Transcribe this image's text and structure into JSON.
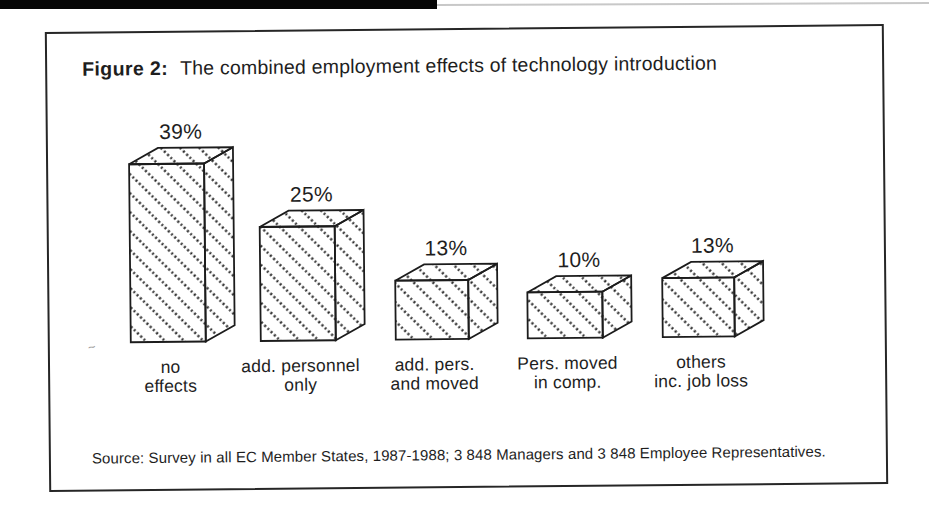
{
  "figure": {
    "label": "Figure 2:",
    "title": "The combined employment effects of technology introduction",
    "source": "Source: Survey in all EC Member States, 1987-1988; 3 848 Managers and 3 848 Employee Representatives."
  },
  "chart_data": {
    "type": "bar",
    "style": "3d-hatched-boxes",
    "unit": "%",
    "title": "The combined employment effects of technology introduction",
    "categories": [
      "no effects",
      "add. personnel only",
      "add. pers. and moved",
      "Pers. moved in comp.",
      "others inc. job loss"
    ],
    "values": [
      39,
      25,
      13,
      10,
      13
    ],
    "ylim": [
      0,
      40
    ],
    "grid": false,
    "axes_shown": false,
    "legend": "none",
    "points": [
      {
        "id": "no-effects",
        "value": 39,
        "value_label": "39%",
        "label_lines": [
          "no",
          "effects"
        ]
      },
      {
        "id": "add-personnel-only",
        "value": 25,
        "value_label": "25%",
        "label_lines": [
          "add. personnel",
          "only"
        ]
      },
      {
        "id": "add-pers-and-moved",
        "value": 13,
        "value_label": "13%",
        "label_lines": [
          "add. pers.",
          "and moved"
        ]
      },
      {
        "id": "pers-moved-in-comp",
        "value": 10,
        "value_label": "10%",
        "label_lines": [
          "Pers. moved",
          "in comp."
        ]
      },
      {
        "id": "others-inc-job-loss",
        "value": 13,
        "value_label": "13%",
        "label_lines": [
          "others",
          "inc. job loss"
        ]
      }
    ],
    "colors": {
      "ink": "#1c1c1c",
      "paper": "#ffffff"
    }
  }
}
